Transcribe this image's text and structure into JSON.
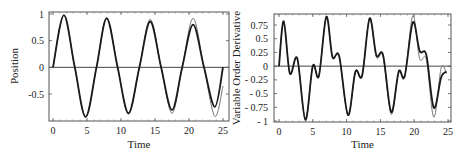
{
  "chart_data": [
    {
      "type": "line",
      "title": "",
      "xlabel": "Time",
      "ylabel": "Position",
      "xlim": [
        0,
        25
      ],
      "ylim": [
        -0.95,
        1.0
      ],
      "xticks": [
        0,
        5,
        10,
        15,
        20,
        25
      ],
      "yticks": [
        1,
        0.5,
        0,
        -0.5
      ],
      "ytick_labels": [
        "1",
        "0.5",
        "0",
        "-0.5"
      ],
      "grid": false,
      "legend": null,
      "series": [
        {
          "name": "reference",
          "style": "thin gray",
          "x": [
            0,
            1.6,
            3.2,
            4.8,
            6.4,
            7.9,
            9.5,
            11.1,
            12.7,
            14.3,
            15.9,
            17.5,
            19.0,
            20.6,
            22.2,
            23.8,
            25
          ],
          "y": [
            0,
            0.98,
            0,
            -0.93,
            0,
            0.93,
            0,
            -0.88,
            0,
            0.9,
            0,
            -0.86,
            0,
            0.92,
            0,
            -0.92,
            -0.35
          ]
        },
        {
          "name": "approximation",
          "style": "thick dark",
          "x": [
            0,
            1.6,
            3.2,
            4.8,
            6.4,
            7.9,
            9.5,
            11.1,
            12.7,
            14.3,
            15.9,
            17.5,
            19.0,
            20.6,
            22.2,
            23.8,
            25
          ],
          "y": [
            0,
            0.98,
            0,
            -0.93,
            0,
            0.92,
            0,
            -0.86,
            0,
            0.86,
            0,
            -0.8,
            0,
            0.8,
            0,
            -0.74,
            0
          ]
        }
      ]
    },
    {
      "type": "line",
      "title": "",
      "xlabel": "Time",
      "ylabel": "Variable Order Derivative",
      "xlim": [
        0,
        25
      ],
      "ylim": [
        -1,
        0.95
      ],
      "xticks": [
        0,
        5,
        10,
        15,
        20,
        25
      ],
      "yticks": [
        0.75,
        0.5,
        0.25,
        0,
        -0.25,
        -0.5,
        -0.75,
        -1
      ],
      "ytick_labels": [
        "0.75",
        "0.5",
        "0.25",
        "0",
        "- 0.25",
        "- 0.5",
        "- 0.75",
        "- 1"
      ],
      "grid": false,
      "legend": null,
      "series": [
        {
          "name": "reference",
          "style": "thin gray",
          "x": [
            0,
            0.7,
            1.6,
            2.7,
            3.9,
            5.0,
            5.9,
            7.0,
            7.9,
            8.9,
            10.2,
            11.3,
            12.3,
            13.4,
            14.4,
            15.4,
            16.6,
            17.7,
            18.6,
            19.8,
            20.8,
            21.8,
            22.9,
            24.0,
            24.8
          ],
          "y": [
            0,
            0.82,
            -0.13,
            0.14,
            -0.98,
            0.0,
            -0.18,
            0.9,
            0.16,
            0.17,
            -0.9,
            -0.12,
            -0.18,
            0.88,
            0.17,
            0.17,
            -0.88,
            -0.12,
            -0.2,
            0.92,
            0.14,
            0.12,
            -0.93,
            -0.03,
            -0.14
          ]
        },
        {
          "name": "approximation",
          "style": "thick dark",
          "x": [
            0,
            0.7,
            1.6,
            2.7,
            3.9,
            5.0,
            5.9,
            7.0,
            7.9,
            8.9,
            10.2,
            11.3,
            12.3,
            13.4,
            14.4,
            15.4,
            16.6,
            17.7,
            18.6,
            19.8,
            20.8,
            21.8,
            22.9,
            24.0,
            24.8
          ],
          "y": [
            0,
            0.82,
            -0.13,
            0.14,
            -0.98,
            0.0,
            -0.18,
            0.9,
            0.17,
            0.18,
            -0.89,
            -0.1,
            -0.17,
            0.87,
            0.2,
            0.2,
            -0.84,
            -0.1,
            -0.18,
            0.8,
            0.28,
            0.2,
            -0.76,
            -0.2,
            -0.1
          ]
        }
      ]
    }
  ],
  "panels": [
    {
      "ylabel": "Position",
      "xlabel": "Time"
    },
    {
      "ylabel": "Variable Order Derivative",
      "xlabel": "Time"
    }
  ]
}
